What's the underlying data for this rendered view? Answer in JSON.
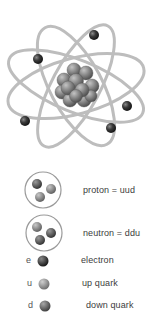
{
  "diagram": {
    "colors": {
      "orbit": "#b8b8b8",
      "electron": "#3a3a3a",
      "up_quark": "#8a8a8a",
      "down_quark": "#5e5e5e",
      "nucleon": "#7a7a7a",
      "text": "#3c3c3c"
    },
    "atom": {
      "electron_count": 5,
      "orbit_count": 4
    },
    "legend": [
      {
        "symbol": "proton-icon",
        "letter": "",
        "label": "proton = uud"
      },
      {
        "symbol": "neutron-icon",
        "letter": "",
        "label": "neutron = ddu"
      },
      {
        "symbol": "electron-icon",
        "letter": "e",
        "label": "electron"
      },
      {
        "symbol": "up-quark-icon",
        "letter": "u",
        "label": "up quark"
      },
      {
        "symbol": "down-quark-icon",
        "letter": "d",
        "label": "down quark"
      }
    ]
  }
}
